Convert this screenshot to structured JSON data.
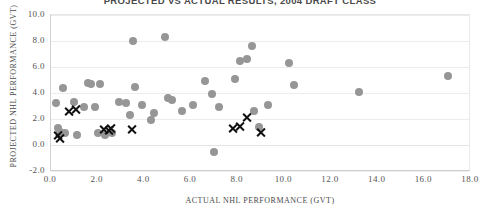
{
  "chart_data": {
    "type": "scatter",
    "title": "PROJECTED VS ACTUAL RESULTS, 2004 DRAFT CLASS",
    "xlabel": "ACTUAL NHL PERFORMANCE (GVT)",
    "ylabel": "PROJECTED NHL PERFORMANCE (GVT)",
    "xlim": [
      0.0,
      18.0
    ],
    "ylim": [
      -2.0,
      10.0
    ],
    "xticks": [
      "0.0",
      "2.0",
      "4.0",
      "6.0",
      "8.0",
      "10.0",
      "12.0",
      "14.0",
      "16.0",
      "18.0"
    ],
    "yticks": [
      "10.0",
      "8.0",
      "6.0",
      "4.0",
      "2.0",
      "0.0",
      "-2.0"
    ],
    "grid": true,
    "legend": "none",
    "series": [
      {
        "name": "gray-circles",
        "marker": "circle",
        "color": "#969696",
        "points": [
          [
            0.2,
            3.2
          ],
          [
            0.3,
            1.3
          ],
          [
            0.4,
            1.0
          ],
          [
            0.5,
            4.4
          ],
          [
            0.6,
            0.9
          ],
          [
            1.0,
            3.3
          ],
          [
            1.1,
            0.8
          ],
          [
            1.4,
            2.9
          ],
          [
            1.6,
            4.8
          ],
          [
            1.7,
            4.7
          ],
          [
            1.9,
            2.9
          ],
          [
            2.0,
            0.9
          ],
          [
            2.1,
            4.7
          ],
          [
            2.3,
            0.8
          ],
          [
            2.6,
            0.9
          ],
          [
            2.9,
            3.3
          ],
          [
            3.2,
            3.2
          ],
          [
            3.4,
            2.3
          ],
          [
            3.5,
            8.0
          ],
          [
            3.6,
            4.5
          ],
          [
            3.9,
            3.1
          ],
          [
            4.3,
            1.9
          ],
          [
            4.4,
            2.5
          ],
          [
            4.9,
            8.3
          ],
          [
            5.0,
            3.6
          ],
          [
            5.2,
            3.5
          ],
          [
            5.6,
            2.6
          ],
          [
            6.1,
            3.1
          ],
          [
            6.6,
            4.9
          ],
          [
            6.9,
            3.9
          ],
          [
            7.0,
            -0.5
          ],
          [
            7.2,
            2.9
          ],
          [
            7.9,
            5.1
          ],
          [
            8.1,
            6.5
          ],
          [
            8.4,
            6.6
          ],
          [
            8.6,
            7.6
          ],
          [
            8.7,
            2.6
          ],
          [
            8.9,
            1.4
          ],
          [
            9.3,
            3.1
          ],
          [
            10.2,
            6.3
          ],
          [
            10.4,
            4.6
          ],
          [
            13.2,
            4.1
          ],
          [
            17.0,
            5.3
          ]
        ]
      },
      {
        "name": "black-x-markers",
        "marker": "x",
        "color": "#111111",
        "points": [
          [
            0.3,
            0.7
          ],
          [
            0.4,
            0.5
          ],
          [
            0.8,
            2.6
          ],
          [
            1.1,
            2.7
          ],
          [
            2.3,
            1.2
          ],
          [
            2.5,
            1.1
          ],
          [
            2.6,
            1.3
          ],
          [
            3.5,
            1.2
          ],
          [
            7.8,
            1.3
          ],
          [
            8.1,
            1.4
          ],
          [
            8.4,
            2.1
          ],
          [
            9.0,
            1.0
          ]
        ]
      }
    ]
  }
}
